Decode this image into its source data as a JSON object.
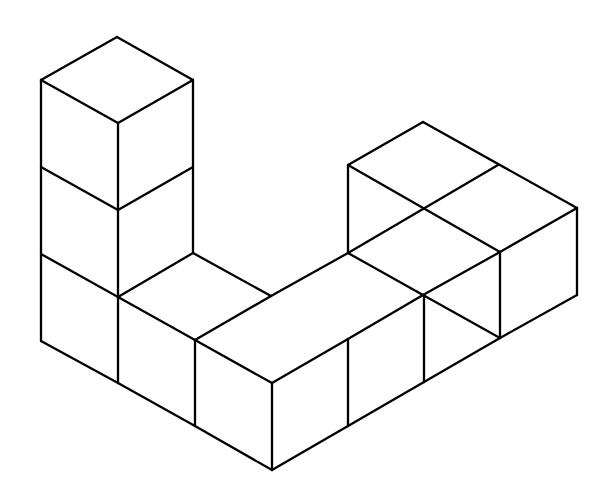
{
  "diagram": {
    "type": "isometric-cube-structure",
    "cube_count": 11,
    "stroke_color": "#000000",
    "background_color": "#ffffff",
    "edges": [
      [
        117,
        37,
        41,
        80
      ],
      [
        117,
        37,
        193,
        80
      ],
      [
        41,
        80,
        118,
        123
      ],
      [
        193,
        80,
        118,
        123
      ],
      [
        41,
        80,
        41,
        341
      ],
      [
        118,
        123,
        118,
        383
      ],
      [
        193,
        80,
        193,
        253
      ],
      [
        41,
        167,
        118,
        210
      ],
      [
        118,
        210,
        193,
        167
      ],
      [
        41,
        254,
        118,
        297
      ],
      [
        118,
        297,
        193,
        253
      ],
      [
        193,
        253,
        271,
        296
      ],
      [
        118,
        297,
        195,
        340
      ],
      [
        195,
        340,
        271,
        296
      ],
      [
        271,
        296,
        348,
        253
      ],
      [
        195,
        340,
        272,
        383
      ],
      [
        272,
        383,
        348,
        339
      ],
      [
        348,
        339,
        423,
        295
      ],
      [
        423,
        295,
        500,
        252
      ],
      [
        500,
        252,
        577,
        208
      ],
      [
        348,
        253,
        423,
        295
      ],
      [
        423,
        295,
        500,
        338
      ],
      [
        348,
        253,
        348,
        165
      ],
      [
        348,
        165,
        423,
        122
      ],
      [
        423,
        122,
        577,
        208
      ],
      [
        348,
        165,
        500,
        252
      ],
      [
        423,
        209,
        498,
        165
      ],
      [
        423,
        209,
        348,
        253
      ],
      [
        195,
        340,
        195,
        426
      ],
      [
        272,
        383,
        272,
        470
      ],
      [
        348,
        339,
        348,
        426
      ],
      [
        424,
        295,
        424,
        382
      ],
      [
        500,
        252,
        500,
        338
      ],
      [
        577,
        208,
        577,
        295
      ],
      [
        41,
        341,
        118,
        383
      ],
      [
        118,
        383,
        195,
        426
      ],
      [
        195,
        426,
        272,
        470
      ],
      [
        272,
        470,
        348,
        426
      ],
      [
        348,
        426,
        424,
        382
      ],
      [
        424,
        382,
        500,
        338
      ],
      [
        500,
        338,
        577,
        295
      ]
    ]
  }
}
